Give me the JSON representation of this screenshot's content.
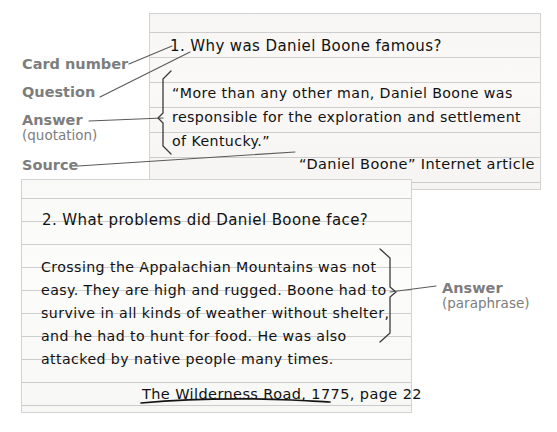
{
  "figure": {
    "kind": "note-card-diagram",
    "ink_color": "#111111",
    "label_color": "#7d7d7d",
    "card_background": "#fbfbfa",
    "rule_color": "#cfcfcf"
  },
  "labels": {
    "card_number": "Card number",
    "question": "Question",
    "answer_quotation_main": "Answer",
    "answer_quotation_sub": "(quotation)",
    "source": "Source",
    "answer_paraphrase_main": "Answer",
    "answer_paraphrase_sub": "(paraphrase)"
  },
  "cards": [
    {
      "id": "card-1",
      "number": "1.",
      "question": "1. Why was Daniel Boone famous?",
      "answer_lines": [
        "“More than any other man, Daniel Boone was",
        "responsible for the exploration and settlement",
        "of Kentucky.”"
      ],
      "source": "“Daniel Boone” Internet article"
    },
    {
      "id": "card-2",
      "number": "2.",
      "question": "2. What problems did Daniel Boone face?",
      "answer_lines": [
        "Crossing the Appalachian Mountains was not",
        "easy. They are high and rugged. Boone had to",
        "survive in all kinds of weather without shelter,",
        "and he had to hunt for food. He was also",
        "attacked by native people many times."
      ],
      "source": "The Wilderness Road, 1775, page 22"
    }
  ]
}
